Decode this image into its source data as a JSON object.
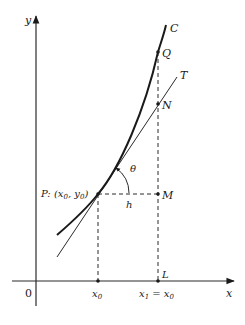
{
  "diagram": {
    "type": "tangent-line-derivative-figure",
    "axes": {
      "x_label": "x",
      "y_label": "y",
      "origin_label": "0"
    },
    "curve": {
      "label": "C"
    },
    "tangent": {
      "label": "T"
    },
    "points": {
      "P": {
        "label": "P: (x",
        "sub0": "0",
        "mid": ", y",
        "sub1": "0",
        "end": ")"
      },
      "M": {
        "label": "M"
      },
      "N": {
        "label": "N"
      },
      "Q": {
        "label": "Q"
      },
      "L": {
        "label": "L"
      }
    },
    "angle_label": "θ",
    "increment_label": "h",
    "ticks": {
      "x0": {
        "main": "x",
        "sub": "0"
      },
      "x1": {
        "main": "x",
        "sub": "1",
        "eq": " = x",
        "sub2": "0"
      }
    }
  }
}
